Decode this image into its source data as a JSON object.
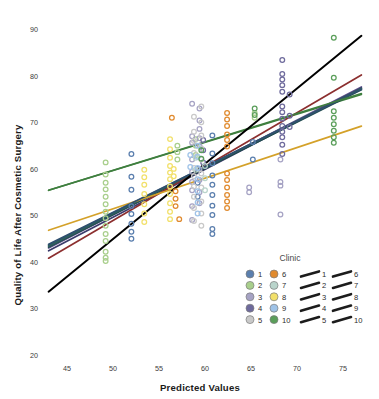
{
  "chart_data": {
    "type": "scatter",
    "title": "",
    "xlabel": "Predicted Values",
    "ylabel": "Quality of Life After Cosmetic Surgery",
    "xlim": [
      42.5,
      77.5
    ],
    "ylim": [
      20,
      92
    ],
    "xticks": [
      45,
      50,
      55,
      60,
      65,
      70,
      75
    ],
    "yticks": [
      20,
      30,
      40,
      50,
      60,
      70,
      80,
      90
    ],
    "grid": false,
    "legend": {
      "title": "Clinic",
      "position": "bottom-right",
      "marker_column_1": [
        "1",
        "2",
        "3",
        "4",
        "5"
      ],
      "marker_column_2": [
        "6",
        "7",
        "8",
        "9",
        "10"
      ],
      "line_column_1": [
        "1",
        "2",
        "3",
        "4",
        "5"
      ],
      "line_column_2": [
        "6",
        "7",
        "8",
        "9",
        "10"
      ]
    },
    "series": [
      {
        "name": "1",
        "color": "#5b7fae",
        "line_color": "#2f4f6f",
        "line": {
          "x1": 43.0,
          "y1": 43.6,
          "x2": 77.0,
          "y2": 77.2
        },
        "points": [
          [
            52.0,
            63.2
          ],
          [
            52.0,
            58.3
          ],
          [
            52.0,
            55.5
          ],
          [
            52.0,
            52.0
          ],
          [
            52.0,
            50.3
          ],
          [
            52.0,
            48.2
          ],
          [
            52.0,
            46.5
          ],
          [
            52.0,
            45.0
          ],
          [
            60.8,
            67.2
          ],
          [
            60.8,
            63.3
          ],
          [
            60.8,
            61.2
          ],
          [
            60.8,
            58.6
          ],
          [
            60.8,
            56.6
          ],
          [
            60.8,
            54.4
          ],
          [
            60.8,
            52.1
          ],
          [
            60.8,
            50.1
          ],
          [
            60.8,
            47.1
          ],
          [
            60.8,
            46.0
          ],
          [
            59.2,
            60.0
          ],
          [
            59.2,
            57.0
          ],
          [
            59.2,
            54.0
          ],
          [
            65.2,
            65.8
          ],
          [
            65.2,
            62.0
          ]
        ]
      },
      {
        "name": "2",
        "color": "#a9cf8c",
        "line_color": "#3f7f3f",
        "line": {
          "x1": 43.0,
          "y1": 55.4,
          "x2": 77.0,
          "y2": 76.0
        },
        "points": [
          [
            49.2,
            61.4
          ],
          [
            49.2,
            58.8
          ],
          [
            49.2,
            57.0
          ],
          [
            49.2,
            55.6
          ],
          [
            49.2,
            54.0
          ],
          [
            49.2,
            52.4
          ],
          [
            49.2,
            50.8
          ],
          [
            49.2,
            49.4
          ],
          [
            49.2,
            47.8
          ],
          [
            49.2,
            46.0
          ],
          [
            49.2,
            44.5
          ],
          [
            49.2,
            42.2
          ],
          [
            49.2,
            40.9
          ],
          [
            49.2,
            40.2
          ],
          [
            57.0,
            65.0
          ],
          [
            57.0,
            63.6
          ],
          [
            57.0,
            62.0
          ],
          [
            59.0,
            66.4
          ],
          [
            59.0,
            65.0
          ],
          [
            59.0,
            63.0
          ],
          [
            65.4,
            72.0
          ],
          [
            65.4,
            71.0
          ]
        ]
      },
      {
        "name": "3",
        "color": "#a6a3c4",
        "line_color": "#5a4f8a",
        "line": {
          "x1": 43.0,
          "y1": 43.0,
          "x2": 77.0,
          "y2": 77.6
        },
        "points": [
          [
            58.6,
            74.0
          ],
          [
            58.6,
            67.0
          ],
          [
            58.6,
            65.6
          ],
          [
            58.6,
            62.0
          ],
          [
            58.6,
            59.4
          ],
          [
            58.6,
            57.2
          ],
          [
            58.6,
            55.4
          ],
          [
            58.6,
            52.0
          ],
          [
            58.6,
            49.0
          ],
          [
            59.4,
            73.0
          ],
          [
            59.4,
            70.4
          ],
          [
            59.4,
            68.6
          ],
          [
            59.4,
            66.6
          ],
          [
            59.4,
            65.0
          ],
          [
            59.4,
            60.0
          ],
          [
            59.4,
            57.6
          ],
          [
            59.4,
            55.0
          ],
          [
            59.4,
            52.6
          ],
          [
            68.2,
            62.0
          ],
          [
            68.2,
            56.4
          ],
          [
            68.2,
            50.2
          ],
          [
            68.2,
            57.2
          ],
          [
            64.8,
            56.0
          ],
          [
            64.8,
            55.0
          ]
        ]
      },
      {
        "name": "4",
        "color": "#6e6a9c",
        "line_color": "#3b3b6b",
        "line": {
          "x1": 43.0,
          "y1": 42.4,
          "x2": 77.0,
          "y2": 77.4
        },
        "points": [
          [
            68.4,
            83.4
          ],
          [
            68.4,
            80.4
          ],
          [
            68.4,
            79.2
          ],
          [
            68.4,
            78.0
          ],
          [
            68.4,
            76.6
          ],
          [
            68.4,
            73.4
          ],
          [
            68.4,
            72.2
          ],
          [
            68.4,
            70.8
          ],
          [
            68.4,
            69.2
          ],
          [
            68.4,
            68.0
          ],
          [
            68.4,
            66.8
          ],
          [
            68.4,
            65.2
          ],
          [
            68.4,
            63.2
          ],
          [
            69.2,
            76.0
          ],
          [
            69.2,
            71.4
          ],
          [
            69.2,
            69.0
          ],
          [
            59.8,
            66.2
          ],
          [
            59.8,
            64.0
          ],
          [
            59.8,
            61.4
          ]
        ]
      },
      {
        "name": "5",
        "color": "#c9c9c9",
        "line_color": "#1f4c4c",
        "line": {
          "x1": 43.0,
          "y1": 43.2,
          "x2": 77.0,
          "y2": 77.0
        },
        "points": [
          [
            58.8,
            71.2
          ],
          [
            58.8,
            68.0
          ],
          [
            58.8,
            66.0
          ],
          [
            58.8,
            63.4
          ],
          [
            58.8,
            60.2
          ],
          [
            58.8,
            58.4
          ],
          [
            58.8,
            56.2
          ],
          [
            58.8,
            54.0
          ],
          [
            58.8,
            51.6
          ],
          [
            58.8,
            48.8
          ],
          [
            59.6,
            73.4
          ],
          [
            59.6,
            70.0
          ],
          [
            59.6,
            67.2
          ],
          [
            59.6,
            64.4
          ],
          [
            59.6,
            62.0
          ],
          [
            59.6,
            59.0
          ],
          [
            59.6,
            56.0
          ],
          [
            59.6,
            53.0
          ],
          [
            59.6,
            50.4
          ],
          [
            59.6,
            47.8
          ]
        ]
      },
      {
        "name": "6",
        "color": "#e08a2e",
        "line_color": "#8c2f2f",
        "line": {
          "x1": 43.0,
          "y1": 40.8,
          "x2": 77.0,
          "y2": 80.2
        },
        "points": [
          [
            56.4,
            71.0
          ],
          [
            62.4,
            72.0
          ],
          [
            62.4,
            70.6
          ],
          [
            62.4,
            69.2
          ],
          [
            62.4,
            67.4
          ],
          [
            62.4,
            66.2
          ],
          [
            62.4,
            64.8
          ],
          [
            62.4,
            59.0
          ],
          [
            62.4,
            57.6
          ],
          [
            62.4,
            56.0
          ],
          [
            62.4,
            54.4
          ],
          [
            62.4,
            53.0
          ],
          [
            62.4,
            51.6
          ],
          [
            56.8,
            55.2
          ],
          [
            56.8,
            53.6
          ],
          [
            56.8,
            52.0
          ],
          [
            57.2,
            49.2
          ]
        ]
      },
      {
        "name": "7",
        "color": "#b9d4cb",
        "line_color": "#2f5f5f",
        "line": {
          "x1": 43.0,
          "y1": 43.4,
          "x2": 77.0,
          "y2": 77.3
        },
        "points": [
          [
            60.0,
            60.6
          ],
          [
            60.0,
            58.0
          ],
          [
            60.0,
            55.4
          ],
          [
            59.0,
            62.4
          ],
          [
            59.0,
            59.8
          ]
        ]
      },
      {
        "name": "8",
        "color": "#f2e06a",
        "line_color": "#d4a129",
        "line": {
          "x1": 43.0,
          "y1": 46.8,
          "x2": 77.0,
          "y2": 69.2
        },
        "points": [
          [
            53.4,
            59.8
          ],
          [
            53.4,
            58.2
          ],
          [
            53.4,
            56.6
          ],
          [
            53.4,
            54.6
          ],
          [
            53.4,
            52.4
          ],
          [
            53.4,
            50.4
          ],
          [
            53.4,
            48.6
          ],
          [
            56.2,
            66.4
          ],
          [
            56.2,
            64.2
          ],
          [
            56.2,
            62.4
          ],
          [
            56.2,
            60.6
          ],
          [
            56.2,
            59.2
          ],
          [
            56.2,
            57.8
          ],
          [
            56.2,
            56.2
          ],
          [
            56.2,
            54.6
          ],
          [
            56.2,
            52.6
          ],
          [
            56.2,
            50.8
          ],
          [
            56.2,
            49.2
          ],
          [
            56.6,
            60.0
          ],
          [
            56.6,
            58.4
          ]
        ]
      },
      {
        "name": "9",
        "color": "#9fc3e8",
        "line_color": "#2f4f6f",
        "line": {
          "x1": 43.0,
          "y1": 43.8,
          "x2": 77.0,
          "y2": 77.1
        },
        "points": [
          [
            59.2,
            65.0
          ],
          [
            59.2,
            62.6
          ],
          [
            59.2,
            60.2
          ],
          [
            59.2,
            57.8
          ],
          [
            59.2,
            55.2
          ],
          [
            59.2,
            52.8
          ],
          [
            59.2,
            50.4
          ],
          [
            58.4,
            63.0
          ],
          [
            58.4,
            60.4
          ]
        ]
      },
      {
        "name": "10",
        "color": "#5a9e5a",
        "line_color": "#3f7f3f",
        "line": {
          "x1": 43.0,
          "y1": 55.4,
          "x2": 77.0,
          "y2": 76.2
        },
        "points": [
          [
            74.0,
            88.2
          ],
          [
            74.0,
            79.6
          ],
          [
            74.0,
            72.4
          ],
          [
            74.0,
            71.0
          ],
          [
            74.0,
            69.6
          ],
          [
            74.0,
            68.2
          ],
          [
            74.0,
            66.8
          ],
          [
            74.0,
            65.6
          ],
          [
            65.4,
            73.0
          ],
          [
            65.4,
            71.6
          ],
          [
            59.6,
            64.0
          ],
          [
            59.6,
            62.2
          ]
        ]
      },
      {
        "name": "overall",
        "color": "#000000",
        "line_color": "#000000",
        "line": {
          "x1": 43.0,
          "y1": 33.6,
          "x2": 77.0,
          "y2": 88.6
        },
        "points": []
      }
    ]
  }
}
